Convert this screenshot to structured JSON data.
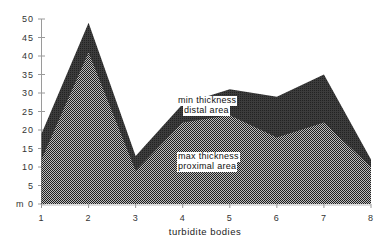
{
  "chart_data": {
    "type": "area",
    "title": "",
    "xlabel": "turbidite bodies",
    "ylabel": "m",
    "x": [
      1,
      2,
      3,
      4,
      5,
      6,
      7,
      8
    ],
    "x_tick_labels": [
      "1",
      "2",
      "3",
      "4",
      "5",
      "6",
      "7",
      "8"
    ],
    "y_tick_labels": [
      "m 0",
      "5",
      "10",
      "15",
      "20",
      "25",
      "30",
      "35",
      "40",
      "45",
      "50"
    ],
    "y_ticks": [
      0,
      5,
      10,
      15,
      20,
      25,
      30,
      35,
      40,
      45,
      50
    ],
    "ylim": [
      0,
      50
    ],
    "xlim": [
      1,
      8
    ],
    "grid": false,
    "series": [
      {
        "name": "min thickness distal area",
        "label_lines": [
          "min thickness",
          "distal area"
        ],
        "values": [
          19,
          49,
          13,
          27,
          31,
          29,
          35,
          12
        ],
        "fill": "#3a3a3a",
        "pattern": "dark"
      },
      {
        "name": "max thickness proximal area",
        "label_lines": [
          "max thickness",
          "proximal area"
        ],
        "values": [
          12,
          41,
          9,
          22,
          24,
          18,
          22,
          10
        ],
        "fill": "#8a8a8a",
        "pattern": "checker"
      }
    ],
    "legend_position": "inline annotations inside areas"
  },
  "labels": {
    "upper_line1": "min thickness",
    "upper_line2": "distal area",
    "lower_line1": "max thickness",
    "lower_line2": "proximal area",
    "xlabel": "turbidite bodies"
  }
}
